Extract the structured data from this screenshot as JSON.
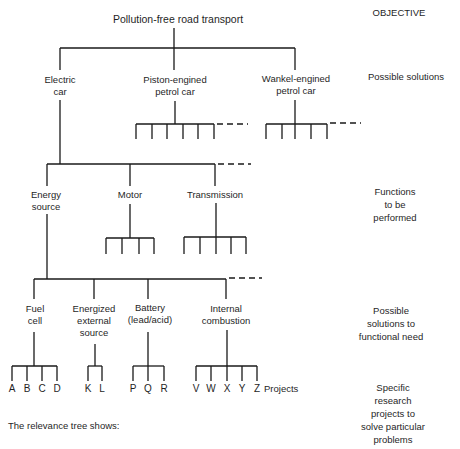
{
  "diagram": {
    "type": "relevance-tree",
    "root": "Pollution-free road transport",
    "levels": [
      {
        "label": "OBJECTIVE",
        "lines": [
          "OBJECTIVE"
        ]
      },
      {
        "label": "Possible solutions",
        "lines": [
          "Possible solutions"
        ]
      },
      {
        "label": "Functions to be performed",
        "lines": [
          "Functions",
          "to be",
          "performed"
        ]
      },
      {
        "label": "Possible solutions to functional need",
        "lines": [
          "Possible",
          "solutions to",
          "functional need"
        ]
      },
      {
        "label": "Specific research projects to solve particular problems",
        "lines": [
          "Specific",
          "research",
          "projects to",
          "solve particular",
          "problems"
        ]
      }
    ],
    "solutions": [
      {
        "name": "Electric car",
        "lines": [
          "Electric",
          "car"
        ]
      },
      {
        "name": "Piston-engined petrol car",
        "lines": [
          "Piston-engined",
          "petrol car"
        ],
        "sub_branches": 6,
        "more": true
      },
      {
        "name": "Wankel-engined petrol car",
        "lines": [
          "Wankel-engined",
          "petrol car"
        ],
        "sub_branches": 5,
        "more": true
      }
    ],
    "functions": [
      {
        "name": "Energy source",
        "lines": [
          "Energy",
          "source"
        ]
      },
      {
        "name": "Motor",
        "lines": [
          "Motor"
        ],
        "sub_branches": 4
      },
      {
        "name": "Transmission",
        "lines": [
          "Transmission"
        ],
        "sub_branches": 5
      }
    ],
    "functions_more": true,
    "energy_solutions": [
      {
        "name": "Fuel cell",
        "lines": [
          "Fuel",
          "cell"
        ],
        "projects": [
          "A",
          "B",
          "C",
          "D"
        ]
      },
      {
        "name": "Energized external source",
        "lines": [
          "Energized",
          "external",
          "source"
        ],
        "projects": [
          "K",
          "L"
        ]
      },
      {
        "name": "Battery (lead/acid)",
        "lines": [
          "Battery",
          "(lead/acid)"
        ],
        "projects": [
          "P",
          "Q",
          "R"
        ]
      },
      {
        "name": "Internal combustion",
        "lines": [
          "Internal",
          "combustion"
        ],
        "projects": [
          "V",
          "W",
          "X",
          "Y",
          "Z"
        ]
      }
    ],
    "energy_solutions_more": true,
    "projects_label": "Projects",
    "caption": "The relevance tree shows:"
  }
}
